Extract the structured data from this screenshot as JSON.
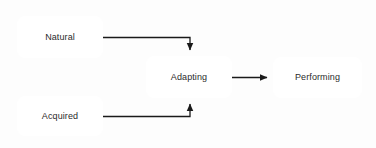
{
  "diagram": {
    "type": "flowchart",
    "title": "",
    "background_color": "#fdfdfd",
    "node_border_color": "#2b2b2b",
    "node_fill_color": "#ffffff",
    "edge_color": "#1a1a1a",
    "text_color": "#2b2b2b",
    "nodes": [
      {
        "id": "natural",
        "label": "Natural",
        "shape": "rounded-rect"
      },
      {
        "id": "acquired",
        "label": "Acquired",
        "shape": "rounded-rect"
      },
      {
        "id": "adapting",
        "label": "Adapting",
        "shape": "rounded-rect"
      },
      {
        "id": "performing",
        "label": "Performing",
        "shape": "rounded-rect"
      }
    ],
    "edges": [
      {
        "id": "natural-to-adapting",
        "from": "Natural",
        "to": "Adapting",
        "label": "",
        "style": "orthogonal-arrow"
      },
      {
        "id": "acquired-to-adapting",
        "from": "Acquired",
        "to": "Adapting",
        "label": "",
        "style": "orthogonal-arrow"
      },
      {
        "id": "adapting-to-performing",
        "from": "Adapting",
        "to": "Performing",
        "label": "",
        "style": "straight-arrow"
      }
    ]
  }
}
